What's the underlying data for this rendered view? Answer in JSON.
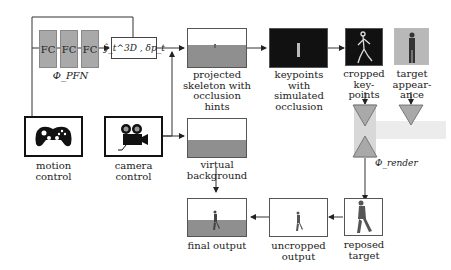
{
  "diagram": {
    "pfn": {
      "blocks": [
        "FC",
        "FC",
        "FC"
      ],
      "label": "Φ_PFN",
      "output_label": "ŷ_t^3D , δp_t"
    },
    "controls": {
      "motion": {
        "label_line1": "motion",
        "label_line2": "control",
        "icon": "gamepad-icon"
      },
      "camera": {
        "label_line1": "camera",
        "label_line2": "control",
        "icon": "movie-camera-icon"
      }
    },
    "nodes": {
      "projected": {
        "lines": [
          "projected",
          "skeleton with",
          "occlusion",
          "hints"
        ]
      },
      "keypoints": {
        "lines": [
          "keypoints",
          "with",
          "simulated",
          "occlusion"
        ]
      },
      "cropped": {
        "lines": [
          "cropped",
          "key-",
          "points"
        ]
      },
      "target": {
        "lines": [
          "target",
          "appear-",
          "ance"
        ]
      },
      "virtual_bg": {
        "lines": [
          "virtual",
          "background"
        ]
      },
      "render": {
        "label": "Φ_render"
      },
      "reposed": {
        "lines": [
          "reposed",
          "target"
        ]
      },
      "uncropped": {
        "lines": [
          "uncropped",
          "output"
        ]
      },
      "final": {
        "lines": [
          "final output"
        ]
      }
    },
    "colors": {
      "fc_block": "#a9a9a9",
      "ground": "#8f8f8f",
      "dark_frame": "#111111",
      "render_bg": "#d8d8d8",
      "triangle": "#a9a9a9"
    }
  }
}
